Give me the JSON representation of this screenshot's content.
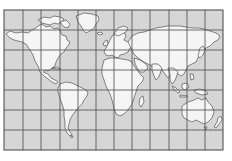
{
  "map": {
    "title": "World map (Mercator projection) with graticule",
    "projection": "Mercator",
    "colors": {
      "ocean": "#d6d6d6",
      "land": "#f5f5f5",
      "coastline": "#3a3a3a",
      "grid": "#4a4a4a",
      "background": "#ffffff"
    },
    "frame": {
      "x": 4,
      "y": 10,
      "width": 219,
      "height": 140
    },
    "grid": {
      "columns": 12,
      "rows": 7,
      "vertical_lines_x": [
        4,
        23,
        41,
        60,
        78,
        96,
        114,
        132,
        150,
        169,
        187,
        205,
        223
      ],
      "horizontal_lines_y": [
        10,
        30,
        50,
        70,
        90,
        110,
        130,
        150
      ]
    },
    "regions": [
      {
        "name": "North America"
      },
      {
        "name": "Greenland"
      },
      {
        "name": "South America"
      },
      {
        "name": "Europe"
      },
      {
        "name": "Africa"
      },
      {
        "name": "Asia"
      },
      {
        "name": "Australia"
      },
      {
        "name": "Japan"
      },
      {
        "name": "New Zealand"
      }
    ]
  }
}
